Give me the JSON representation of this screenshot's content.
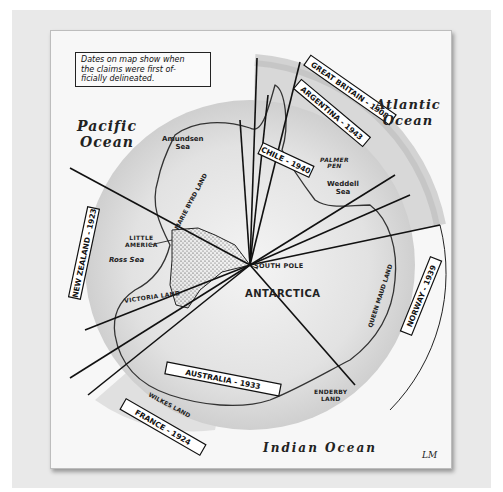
{
  "map": {
    "note": "Dates on map show when the claims were first officially delineated.",
    "note_lines": [
      "Dates on map show when",
      "the claims were first of-",
      "ficially delineated."
    ],
    "oceans": {
      "pacific": {
        "line1": "Pacific",
        "line2": "Ocean"
      },
      "atlantic": {
        "line1": "Atlantic",
        "line2": "Ocean"
      },
      "indian": "Indian Ocean"
    },
    "continent": "ANTARCTICA",
    "south_pole": "SOUTH POLE",
    "places": {
      "amundsen_sea": {
        "line1": "Amundsen",
        "line2": "Sea"
      },
      "marie_byrd_land": "MARIE BYRD LAND",
      "little_america": {
        "line1": "LITTLE",
        "line2": "AMERICA"
      },
      "ross_sea": "Ross Sea",
      "victoria_land": "VICTORIA LAND",
      "wilkes_land": "WILKES LAND",
      "palmer_pen": {
        "line1": "PALMER",
        "line2": "PEN"
      },
      "weddell_sea": {
        "line1": "Weddell",
        "line2": "Sea"
      },
      "queen_maud_land": "QUEEN MAUD LAND",
      "enderby_land": {
        "line1": "ENDERBY",
        "line2": "LAND"
      }
    },
    "claims": [
      {
        "name": "GREAT BRITAIN",
        "year": "1908",
        "label": "GREAT BRITAIN - 1908"
      },
      {
        "name": "ARGENTINA",
        "year": "1943",
        "label": "ARGENTINA - 1943"
      },
      {
        "name": "CHILE",
        "year": "1940",
        "label": "CHILE - 1940"
      },
      {
        "name": "NORWAY",
        "year": "1939",
        "label": "NORWAY - 1939"
      },
      {
        "name": "AUSTRALIA",
        "year": "1933",
        "label": "AUSTRALIA - 1933"
      },
      {
        "name": "FRANCE",
        "year": "1924",
        "label": "FRANCE - 1924"
      },
      {
        "name": "NEW ZEALAND",
        "year": "1923",
        "label": "NEW ZEALAND - 1923"
      }
    ],
    "signature": "LM",
    "colors": {
      "mat": "#e9e9e9",
      "paper": "#f7f7f7",
      "claim_shade": "#c9c9c9",
      "land_gradient_center": "#f2f2f2",
      "land_gradient_edge": "#cfcfcf",
      "ink": "#222222"
    }
  }
}
